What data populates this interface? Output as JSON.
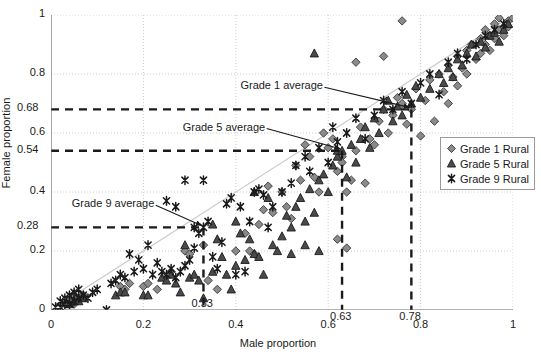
{
  "chart_data": {
    "type": "scatter",
    "title": "",
    "xlabel": "Male proportion",
    "ylabel": "Female proportion",
    "xlim": [
      0,
      1
    ],
    "ylim": [
      0,
      1
    ],
    "xticks": [
      "0",
      "0.2",
      "0.4",
      "0.6",
      "0.8",
      "1"
    ],
    "xtick_values": [
      0,
      0.2,
      0.4,
      0.6,
      0.8,
      1
    ],
    "yticks": [
      "0",
      "0.2",
      "0.4",
      "0.6",
      "0.8",
      "1"
    ],
    "ytick_values": [
      0,
      0.2,
      0.4,
      0.6,
      0.8,
      1
    ],
    "grid": "dotted horizontal and vertical at major ticks",
    "legend_position": "right-middle",
    "identity_line": {
      "label": "y = x reference line",
      "color": "#c9c9c9",
      "from": [
        0,
        0
      ],
      "to": [
        1,
        1
      ]
    },
    "reference_labels": {
      "y": [
        "0.68",
        "0.54",
        "0.28"
      ],
      "x": [
        "0.63",
        "0.78",
        "0.33"
      ]
    },
    "annotations": [
      {
        "text": "Grade 1 average",
        "point": [
          0.78,
          0.68
        ],
        "label_pos": [
          0.41,
          0.755
        ]
      },
      {
        "text": "Grade 5 average",
        "point": [
          0.63,
          0.54
        ],
        "label_pos": [
          0.285,
          0.615
        ]
      },
      {
        "text": "Grade 9 average",
        "point": [
          0.33,
          0.28
        ],
        "label_pos": [
          0.045,
          0.355
        ]
      }
    ],
    "guide_lines": [
      {
        "series": "Grade 1 Rural",
        "y": 0.68,
        "x": 0.78,
        "style": "dashed",
        "color": "#1a1a1a"
      },
      {
        "series": "Grade 5 Rural",
        "y": 0.54,
        "x": 0.63,
        "style": "dashed",
        "color": "#1a1a1a"
      },
      {
        "series": "Grade 9 Rural",
        "y": 0.28,
        "x": 0.33,
        "style": "dashed",
        "color": "#1a1a1a"
      }
    ],
    "series": [
      {
        "name": "Grade 1 Rural",
        "marker": "diamond",
        "color": "#8a8a8a",
        "edge": "#3a3a3a",
        "mean": [
          0.78,
          0.68
        ],
        "points": [
          [
            0.03,
            0.02
          ],
          [
            0.04,
            0.03
          ],
          [
            0.05,
            0.02
          ],
          [
            0.05,
            0.05
          ],
          [
            0.06,
            0.04
          ],
          [
            0.07,
            0.05
          ],
          [
            0.15,
            0.08
          ],
          [
            0.16,
            0.07
          ],
          [
            0.17,
            0.09
          ],
          [
            0.2,
            0.08
          ],
          [
            0.21,
            0.09
          ],
          [
            0.23,
            0.07
          ],
          [
            0.26,
            0.13
          ],
          [
            0.29,
            0.2
          ],
          [
            0.3,
            0.19
          ],
          [
            0.33,
            0.22
          ],
          [
            0.34,
            0.1
          ],
          [
            0.36,
            0.07
          ],
          [
            0.4,
            0.2
          ],
          [
            0.42,
            0.26
          ],
          [
            0.43,
            0.2
          ],
          [
            0.44,
            0.19
          ],
          [
            0.45,
            0.29
          ],
          [
            0.46,
            0.34
          ],
          [
            0.47,
            0.42
          ],
          [
            0.48,
            0.33
          ],
          [
            0.5,
            0.4
          ],
          [
            0.51,
            0.35
          ],
          [
            0.52,
            0.31
          ],
          [
            0.53,
            0.49
          ],
          [
            0.54,
            0.44
          ],
          [
            0.55,
            0.56
          ],
          [
            0.56,
            0.52
          ],
          [
            0.57,
            0.45
          ],
          [
            0.58,
            0.4
          ],
          [
            0.59,
            0.6
          ],
          [
            0.6,
            0.55
          ],
          [
            0.61,
            0.58
          ],
          [
            0.62,
            0.47
          ],
          [
            0.63,
            0.52
          ],
          [
            0.63,
            0.5
          ],
          [
            0.64,
            0.4
          ],
          [
            0.65,
            0.44
          ],
          [
            0.66,
            0.54
          ],
          [
            0.67,
            0.62
          ],
          [
            0.68,
            0.43
          ],
          [
            0.69,
            0.58
          ],
          [
            0.7,
            0.56
          ],
          [
            0.71,
            0.64
          ],
          [
            0.72,
            0.68
          ],
          [
            0.73,
            0.6
          ],
          [
            0.74,
            0.66
          ],
          [
            0.75,
            0.72
          ],
          [
            0.76,
            0.7
          ],
          [
            0.77,
            0.63
          ],
          [
            0.78,
            0.68
          ],
          [
            0.79,
            0.75
          ],
          [
            0.8,
            0.59
          ],
          [
            0.81,
            0.71
          ],
          [
            0.82,
            0.78
          ],
          [
            0.83,
            0.64
          ],
          [
            0.84,
            0.8
          ],
          [
            0.85,
            0.74
          ],
          [
            0.86,
            0.83
          ],
          [
            0.87,
            0.79
          ],
          [
            0.88,
            0.86
          ],
          [
            0.89,
            0.82
          ],
          [
            0.9,
            0.88
          ],
          [
            0.9,
            0.8
          ],
          [
            0.91,
            0.9
          ],
          [
            0.92,
            0.85
          ],
          [
            0.93,
            0.92
          ],
          [
            0.93,
            0.87
          ],
          [
            0.94,
            0.95
          ],
          [
            0.94,
            0.9
          ],
          [
            0.95,
            0.93
          ],
          [
            0.95,
            0.88
          ],
          [
            0.96,
            0.97
          ],
          [
            0.96,
            0.92
          ],
          [
            0.97,
            0.95
          ],
          [
            0.97,
            0.99
          ],
          [
            0.98,
            0.96
          ],
          [
            0.98,
            0.93
          ],
          [
            0.99,
            0.98
          ],
          [
            0.99,
            0.96
          ],
          [
            1.0,
            0.99
          ],
          [
            0.76,
            0.98
          ],
          [
            0.72,
            0.86
          ],
          [
            0.66,
            0.84
          ],
          [
            0.86,
            0.7
          ],
          [
            0.88,
            0.76
          ],
          [
            0.62,
            0.24
          ],
          [
            0.64,
            0.21
          ]
        ]
      },
      {
        "name": "Grade 5 Rural",
        "marker": "triangle",
        "color": "#4a4a4a",
        "edge": "#1a1a1a",
        "mean": [
          0.63,
          0.54
        ],
        "points": [
          [
            0.04,
            0.02
          ],
          [
            0.05,
            0.03
          ],
          [
            0.06,
            0.03
          ],
          [
            0.07,
            0.04
          ],
          [
            0.14,
            0.05
          ],
          [
            0.15,
            0.06
          ],
          [
            0.16,
            0.06
          ],
          [
            0.2,
            0.05
          ],
          [
            0.21,
            0.05
          ],
          [
            0.24,
            0.11
          ],
          [
            0.25,
            0.1
          ],
          [
            0.26,
            0.12
          ],
          [
            0.27,
            0.09
          ],
          [
            0.28,
            0.06
          ],
          [
            0.29,
            0.22
          ],
          [
            0.3,
            0.11
          ],
          [
            0.31,
            0.12
          ],
          [
            0.32,
            0.1
          ],
          [
            0.33,
            0.04
          ],
          [
            0.35,
            0.13
          ],
          [
            0.36,
            0.24
          ],
          [
            0.37,
            0.18
          ],
          [
            0.38,
            0.12
          ],
          [
            0.39,
            0.07
          ],
          [
            0.4,
            0.15
          ],
          [
            0.42,
            0.17
          ],
          [
            0.43,
            0.24
          ],
          [
            0.44,
            0.19
          ],
          [
            0.45,
            0.18
          ],
          [
            0.46,
            0.12
          ],
          [
            0.48,
            0.22
          ],
          [
            0.5,
            0.25
          ],
          [
            0.51,
            0.32
          ],
          [
            0.52,
            0.28
          ],
          [
            0.53,
            0.35
          ],
          [
            0.54,
            0.38
          ],
          [
            0.55,
            0.3
          ],
          [
            0.56,
            0.41
          ],
          [
            0.57,
            0.33
          ],
          [
            0.58,
            0.44
          ],
          [
            0.59,
            0.46
          ],
          [
            0.6,
            0.4
          ],
          [
            0.61,
            0.49
          ],
          [
            0.62,
            0.52
          ],
          [
            0.62,
            0.54
          ],
          [
            0.63,
            0.54
          ],
          [
            0.64,
            0.45
          ],
          [
            0.65,
            0.56
          ],
          [
            0.66,
            0.5
          ],
          [
            0.67,
            0.58
          ],
          [
            0.68,
            0.62
          ],
          [
            0.69,
            0.55
          ],
          [
            0.7,
            0.65
          ],
          [
            0.71,
            0.6
          ],
          [
            0.72,
            0.68
          ],
          [
            0.73,
            0.71
          ],
          [
            0.74,
            0.64
          ],
          [
            0.75,
            0.69
          ],
          [
            0.76,
            0.66
          ],
          [
            0.77,
            0.73
          ],
          [
            0.78,
            0.7
          ],
          [
            0.79,
            0.76
          ],
          [
            0.8,
            0.72
          ],
          [
            0.82,
            0.75
          ],
          [
            0.84,
            0.8
          ],
          [
            0.85,
            0.77
          ],
          [
            0.86,
            0.82
          ],
          [
            0.87,
            0.79
          ],
          [
            0.88,
            0.85
          ],
          [
            0.89,
            0.83
          ],
          [
            0.9,
            0.87
          ],
          [
            0.91,
            0.9
          ],
          [
            0.92,
            0.86
          ],
          [
            0.93,
            0.91
          ],
          [
            0.94,
            0.89
          ],
          [
            0.95,
            0.93
          ],
          [
            0.96,
            0.94
          ],
          [
            0.97,
            0.91
          ],
          [
            0.98,
            0.95
          ],
          [
            0.99,
            0.97
          ],
          [
            0.57,
            0.87
          ],
          [
            0.44,
            0.4
          ],
          [
            0.47,
            0.38
          ],
          [
            0.35,
            0.29
          ],
          [
            0.4,
            0.3
          ],
          [
            0.41,
            0.26
          ],
          [
            0.49,
            0.2
          ],
          [
            0.52,
            0.19
          ],
          [
            0.55,
            0.22
          ],
          [
            0.58,
            0.2
          ]
        ]
      },
      {
        "name": "Grade 9 Rural",
        "marker": "x-star",
        "color": "#3a3a3a",
        "edge": "#1a1a1a",
        "mean": [
          0.33,
          0.28
        ],
        "points": [
          [
            0.01,
            0.01
          ],
          [
            0.02,
            0.01
          ],
          [
            0.02,
            0.03
          ],
          [
            0.03,
            0.02
          ],
          [
            0.03,
            0.04
          ],
          [
            0.04,
            0.02
          ],
          [
            0.04,
            0.05
          ],
          [
            0.05,
            0.03
          ],
          [
            0.05,
            0.06
          ],
          [
            0.06,
            0.04
          ],
          [
            0.06,
            0.07
          ],
          [
            0.07,
            0.05
          ],
          [
            0.08,
            0.04
          ],
          [
            0.09,
            0.06
          ],
          [
            0.1,
            0.07
          ],
          [
            0.12,
            0.0
          ],
          [
            0.13,
            0.09
          ],
          [
            0.14,
            0.1
          ],
          [
            0.15,
            0.12
          ],
          [
            0.16,
            0.11
          ],
          [
            0.17,
            0.19
          ],
          [
            0.18,
            0.13
          ],
          [
            0.19,
            0.17
          ],
          [
            0.2,
            0.14
          ],
          [
            0.21,
            0.22
          ],
          [
            0.22,
            0.12
          ],
          [
            0.23,
            0.16
          ],
          [
            0.24,
            0.13
          ],
          [
            0.25,
            0.12
          ],
          [
            0.26,
            0.14
          ],
          [
            0.27,
            0.11
          ],
          [
            0.28,
            0.13
          ],
          [
            0.29,
            0.15
          ],
          [
            0.3,
            0.17
          ],
          [
            0.31,
            0.28
          ],
          [
            0.31,
            0.21
          ],
          [
            0.32,
            0.26
          ],
          [
            0.33,
            0.28
          ],
          [
            0.34,
            0.3
          ],
          [
            0.35,
            0.18
          ],
          [
            0.36,
            0.14
          ],
          [
            0.37,
            0.23
          ],
          [
            0.38,
            0.36
          ],
          [
            0.39,
            0.38
          ],
          [
            0.4,
            0.12
          ],
          [
            0.41,
            0.35
          ],
          [
            0.42,
            0.13
          ],
          [
            0.43,
            0.3
          ],
          [
            0.44,
            0.4
          ],
          [
            0.45,
            0.41
          ],
          [
            0.46,
            0.39
          ],
          [
            0.47,
            0.28
          ],
          [
            0.48,
            0.35
          ],
          [
            0.5,
            0.4
          ],
          [
            0.52,
            0.43
          ],
          [
            0.53,
            0.49
          ],
          [
            0.55,
            0.52
          ],
          [
            0.56,
            0.47
          ],
          [
            0.58,
            0.55
          ],
          [
            0.6,
            0.5
          ],
          [
            0.61,
            0.62
          ],
          [
            0.62,
            0.57
          ],
          [
            0.64,
            0.6
          ],
          [
            0.66,
            0.65
          ],
          [
            0.68,
            0.58
          ],
          [
            0.7,
            0.66
          ],
          [
            0.72,
            0.71
          ],
          [
            0.74,
            0.68
          ],
          [
            0.76,
            0.74
          ],
          [
            0.78,
            0.7
          ],
          [
            0.8,
            0.77
          ],
          [
            0.82,
            0.8
          ],
          [
            0.84,
            0.73
          ],
          [
            0.86,
            0.84
          ],
          [
            0.88,
            0.87
          ],
          [
            0.9,
            0.85
          ],
          [
            0.92,
            0.9
          ],
          [
            0.94,
            0.93
          ],
          [
            0.96,
            0.95
          ],
          [
            0.98,
            0.97
          ],
          [
            0.29,
            0.44
          ],
          [
            0.25,
            0.37
          ],
          [
            0.27,
            0.35
          ],
          [
            0.33,
            0.44
          ]
        ]
      }
    ]
  },
  "legend": {
    "items": [
      {
        "label": "Grade 1 Rural",
        "marker": "diamond"
      },
      {
        "label": "Grade 5 Rural",
        "marker": "triangle"
      },
      {
        "label": "Grade 9 Rural",
        "marker": "x-star"
      }
    ]
  }
}
